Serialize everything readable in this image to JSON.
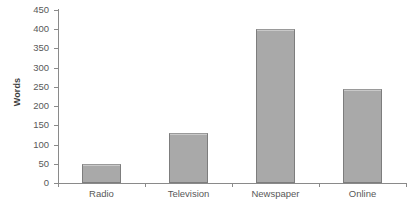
{
  "chart_data": {
    "type": "bar",
    "title": "",
    "subtitle": "",
    "xlabel": "",
    "ylabel": "Words",
    "categories": [
      "Radio",
      "Television",
      "Newspaper",
      "Online"
    ],
    "values": [
      50,
      130,
      400,
      245
    ],
    "ylim": [
      0,
      450
    ],
    "ytick_labels": [
      "0",
      "50",
      "100",
      "150",
      "200",
      "250",
      "300",
      "350",
      "400",
      "450"
    ],
    "ytick_values": [
      0,
      50,
      100,
      150,
      200,
      250,
      300,
      350,
      400,
      450
    ],
    "ytick_step": 50,
    "grid": false,
    "legend": false,
    "legend_position": "none",
    "annotations": [],
    "colors": {
      "bar_fill": "#a9a9a9",
      "bar_border": "#7d7d7d",
      "axis_line": "#8a8a8a",
      "tick_label": "#595959",
      "axis_title": "#3f3f3f",
      "background": "#ffffff"
    }
  }
}
